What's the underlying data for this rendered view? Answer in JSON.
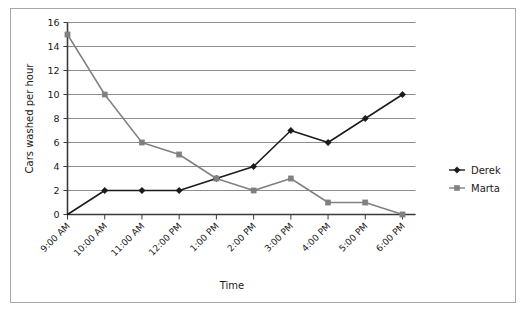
{
  "chart_data": {
    "type": "line",
    "title": "",
    "xlabel": "Time",
    "ylabel": "Cars washed per hour",
    "categories": [
      "9:00 AM",
      "10:00 AM",
      "11:00 AM",
      "12:00 PM",
      "1:00 PM",
      "2:00 PM",
      "3:00 PM",
      "4:00 PM",
      "5:00 PM",
      "6:00 PM"
    ],
    "series": [
      {
        "name": "Derek",
        "color": "#1a1a1a",
        "marker": "diamond",
        "values": [
          0,
          2,
          2,
          2,
          3,
          4,
          7,
          6,
          8,
          10
        ]
      },
      {
        "name": "Marta",
        "color": "#808080",
        "marker": "square",
        "values": [
          15,
          10,
          6,
          5,
          3,
          2,
          3,
          1,
          1,
          0
        ]
      }
    ],
    "ylim": [
      0,
      16
    ],
    "yticks": [
      0,
      2,
      4,
      6,
      8,
      10,
      12,
      14,
      16
    ],
    "ytick_labels": [
      "0",
      "2",
      "4",
      "6",
      "8",
      "10",
      "12",
      "14",
      "16"
    ],
    "grid": true,
    "grid_axis": "y",
    "legend_position": "right",
    "xtick_rotation": -45
  },
  "colors": {
    "derek": "#1a1a1a",
    "marta": "#808080",
    "grid": "#8c8c8c",
    "axis": "#3a3a3a",
    "frame": "#a8a8a8",
    "background": "#ffffff"
  },
  "legend": {
    "entries": [
      {
        "label": "Derek"
      },
      {
        "label": "Marta"
      }
    ]
  }
}
